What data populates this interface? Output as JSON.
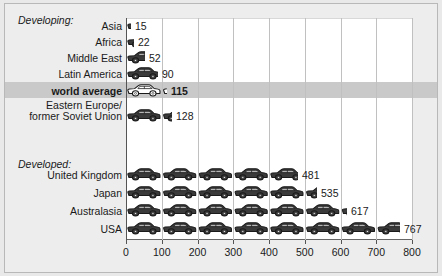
{
  "chart_data": {
    "type": "bar",
    "title": "",
    "subtitle": "",
    "xlabel": "",
    "ylabel": "",
    "xlim": [
      0,
      800
    ],
    "grid": true,
    "unit_note": "",
    "legend_position": "none",
    "pictogram": "car",
    "axis_ticks": [
      0,
      100,
      200,
      300,
      400,
      500,
      600,
      700,
      800
    ],
    "groups": [
      {
        "heading": "Developing:",
        "categories": [
          "Asia",
          "Africa",
          "Middle East",
          "Latin America",
          "world average",
          "Eastern Europe/\nformer Soviet Union"
        ],
        "values": [
          15,
          22,
          52,
          90,
          115,
          128
        ]
      },
      {
        "heading": "Developed:",
        "categories": [
          "United Kingdom",
          "Japan",
          "Australasia",
          "USA"
        ],
        "values": [
          481,
          535,
          617,
          767
        ]
      }
    ],
    "categories": [
      "Asia",
      "Africa",
      "Middle East",
      "Latin America",
      "world average",
      "Eastern Europe/\nformer Soviet Union",
      "United Kingdom",
      "Japan",
      "Australasia",
      "USA"
    ],
    "values": [
      15,
      22,
      52,
      90,
      115,
      128,
      481,
      535,
      617,
      767
    ],
    "highlighted_category": "world average"
  },
  "colors": {
    "page_background": "#e9e9e9",
    "panel_background": "#ededed",
    "plot_background": "#ffffff",
    "gridline": "#c0c0c0",
    "axis": "#555555",
    "car_body": "#3a3a3a",
    "car_highlight_body": "#ffffff",
    "highlight_band": "#c9c9c9",
    "text": "#1a1a1a",
    "border": "#b8b8b8"
  },
  "rows": [
    {
      "label": "Asia",
      "value": 15,
      "value_text": "15",
      "bold": false,
      "white_cars": false
    },
    {
      "label": "Africa",
      "value": 22,
      "value_text": "22",
      "bold": false,
      "white_cars": false
    },
    {
      "label": "Middle East",
      "value": 52,
      "value_text": "52",
      "bold": false,
      "white_cars": false
    },
    {
      "label": "Latin America",
      "value": 90,
      "value_text": "90",
      "bold": false,
      "white_cars": false
    },
    {
      "label": "world average",
      "value": 115,
      "value_text": "115",
      "bold": true,
      "white_cars": true
    },
    {
      "label": "Eastern Europe/\nformer Soviet Union",
      "value": 128,
      "value_text": "128",
      "bold": false,
      "white_cars": false
    },
    {
      "label": "United Kingdom",
      "value": 481,
      "value_text": "481",
      "bold": false,
      "white_cars": false
    },
    {
      "label": "Japan",
      "value": 535,
      "value_text": "535",
      "bold": false,
      "white_cars": false
    },
    {
      "label": "Australasia",
      "value": 617,
      "value_text": "617",
      "bold": false,
      "white_cars": false
    },
    {
      "label": "USA",
      "value": 767,
      "value_text": "767",
      "bold": false,
      "white_cars": false
    }
  ],
  "headings": {
    "developing": "Developing:",
    "developed": "Developed:"
  },
  "ticks": [
    "0",
    "100",
    "200",
    "300",
    "400",
    "500",
    "600",
    "700",
    "800"
  ]
}
